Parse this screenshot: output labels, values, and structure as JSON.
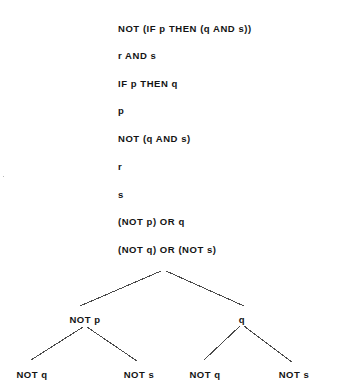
{
  "document": {
    "title": "Logic derivation tree",
    "background_color": "#ffffff",
    "text_color": "#141414"
  },
  "derivation": {
    "label": "formula-derivation-list",
    "lines": [
      {
        "text": "NOT (IF p THEN (q AND s))",
        "y": 23
      },
      {
        "text": "r AND s",
        "y": 50
      },
      {
        "text": "IF p THEN q",
        "y": 78
      },
      {
        "text": "p",
        "y": 105
      },
      {
        "text": "NOT (q AND s)",
        "y": 133
      },
      {
        "text": "r",
        "y": 161
      },
      {
        "text": "s",
        "y": 189
      },
      {
        "text": "(NOT p) OR q",
        "y": 216
      },
      {
        "text": "(NOT q) OR (NOT s)",
        "y": 244
      }
    ]
  },
  "tree": {
    "label": "binary-derivation-tree",
    "root": {
      "text": "(NOT q) OR (NOT s)",
      "x": 160,
      "y": 244
    },
    "level1": [
      {
        "text": "NOT p",
        "x": 85,
        "y": 314
      },
      {
        "text": "q",
        "x": 242,
        "y": 314
      }
    ],
    "leaves": [
      {
        "text": "NOT q",
        "x": 32,
        "y": 369
      },
      {
        "text": "NOT s",
        "x": 139,
        "y": 369
      },
      {
        "text": "NOT q",
        "x": 205,
        "y": 369
      },
      {
        "text": "NOT s",
        "x": 294,
        "y": 369
      }
    ],
    "edges": [
      {
        "name": "root-to-not-p",
        "x1": 161,
        "y1": 271,
        "x2": 80,
        "y2": 306
      },
      {
        "name": "root-to-q",
        "x1": 166,
        "y1": 271,
        "x2": 244,
        "y2": 306
      },
      {
        "name": "not-p-to-not-q",
        "x1": 83,
        "y1": 327,
        "x2": 31,
        "y2": 360
      },
      {
        "name": "not-p-to-not-s",
        "x1": 87,
        "y1": 327,
        "x2": 137,
        "y2": 361
      },
      {
        "name": "q-to-not-q",
        "x1": 240,
        "y1": 326,
        "x2": 204,
        "y2": 360
      },
      {
        "name": "q-to-not-s",
        "x1": 244,
        "y1": 326,
        "x2": 292,
        "y2": 362
      }
    ],
    "edge_color": "#4a4a4a"
  },
  "artifacts": [
    {
      "name": "scan-speck-left",
      "x": 3,
      "y": 176
    }
  ]
}
